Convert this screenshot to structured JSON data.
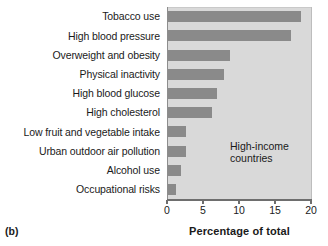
{
  "chart_data": {
    "type": "bar",
    "orientation": "horizontal",
    "title": "",
    "panel_label": "(b)",
    "annotation": "High-income\ncountries",
    "categories": [
      "Tobacco use",
      "High blood pressure",
      "Overweight and obesity",
      "Physical inactivity",
      "High blood glucose",
      "High cholesterol",
      "Low fruit and vegetable intake",
      "Urban outdoor air pollution",
      "Alcohol use",
      "Occupational risks"
    ],
    "values": [
      18.6,
      17.2,
      8.8,
      7.9,
      7.0,
      6.2,
      2.6,
      2.6,
      2.0,
      1.3
    ],
    "xlabel": "Percentage of total",
    "ylabel": "",
    "xlim": [
      0,
      20
    ],
    "xticks": [
      "0",
      "5",
      "10",
      "15",
      "20"
    ],
    "xtick_values": [
      0,
      5,
      10,
      15,
      20
    ],
    "grid": false,
    "legend": "none",
    "colors": {
      "bar": "#8a8a8a",
      "plot_background": "#d9d9d9",
      "axis": "#6e6e6e",
      "text": "#1a1a1a"
    }
  }
}
